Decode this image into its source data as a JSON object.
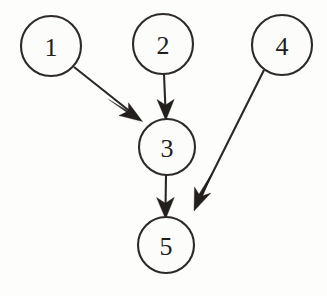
{
  "diagram": {
    "type": "directed-graph",
    "canvas": {
      "width": 327,
      "height": 296,
      "background": "#fdfdfc"
    },
    "style": {
      "node_fill": "#fcfcfb",
      "node_stroke": "#2d2a28",
      "edge_color": "#2a2725",
      "arrow_color": "#231f1d",
      "label_color": "#201d1b",
      "stroke_width": 2.1,
      "arrow_style": "barbed-swallowtail"
    },
    "nodes": [
      {
        "id": "n1",
        "label": "1",
        "cx": 51,
        "cy": 46,
        "r": 30
      },
      {
        "id": "n2",
        "label": "2",
        "cx": 163,
        "cy": 44,
        "r": 30
      },
      {
        "id": "n4",
        "label": "4",
        "cx": 282,
        "cy": 45,
        "r": 30
      },
      {
        "id": "n3",
        "label": "3",
        "cx": 167,
        "cy": 147,
        "r": 28
      },
      {
        "id": "n5",
        "label": "5",
        "cx": 166,
        "cy": 245,
        "r": 28
      }
    ],
    "edges": [
      {
        "id": "e1",
        "from": "1",
        "to": "3",
        "label": "1 to 3",
        "orientation": "diagonal-down-right"
      },
      {
        "id": "e2",
        "from": "2",
        "to": "3",
        "label": "2 to 3",
        "orientation": "vertical-down"
      },
      {
        "id": "e3",
        "from": "3",
        "to": "5",
        "label": "3 to 5",
        "orientation": "vertical-down"
      },
      {
        "id": "e4",
        "from": "4",
        "to": "5",
        "label": "4 to 5",
        "orientation": "diagonal-down-left"
      }
    ],
    "adjacency_text": "1->3, 2->3, 3->5, 4->5"
  }
}
